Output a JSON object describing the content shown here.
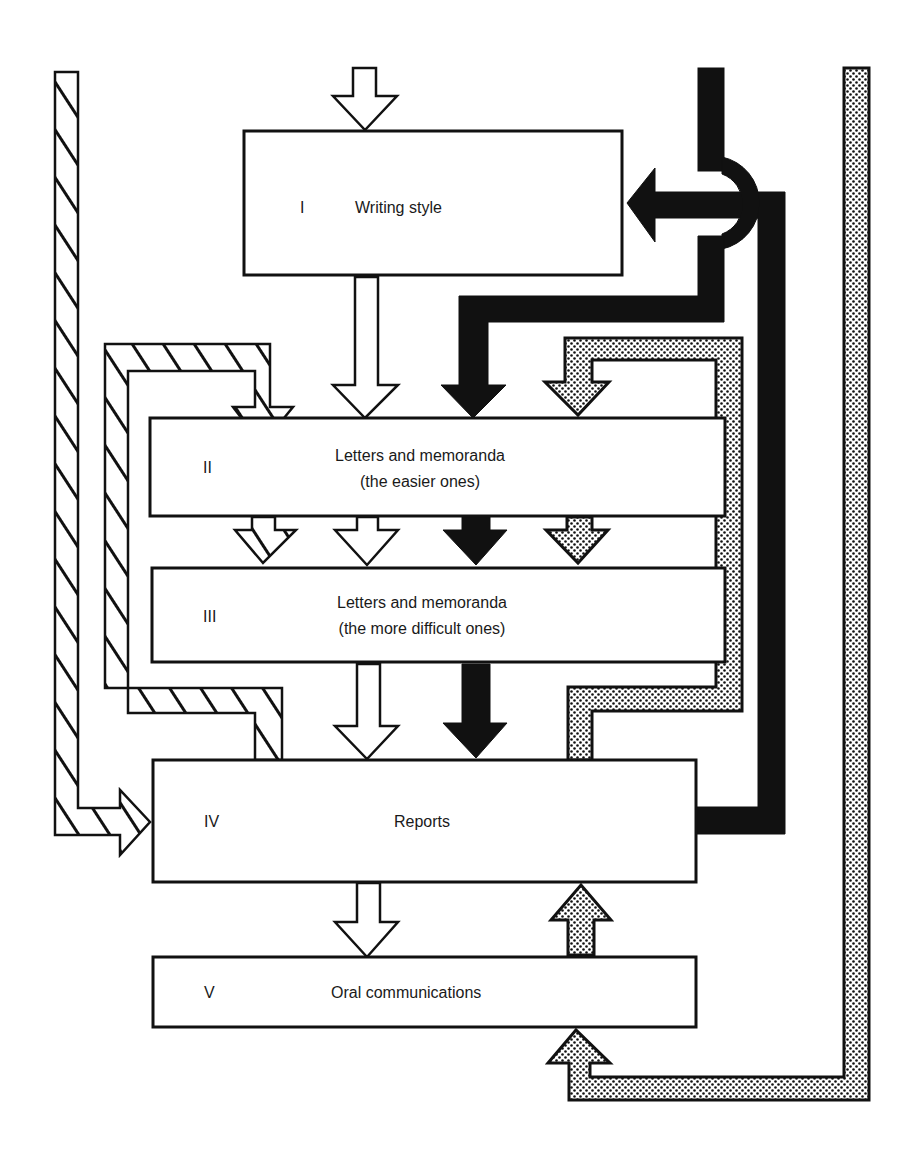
{
  "diagram": {
    "type": "flow-diagram",
    "boxes": [
      {
        "id": "I",
        "numeral": "I",
        "line1": "Writing style",
        "line2": ""
      },
      {
        "id": "II",
        "numeral": "II",
        "line1": "Letters and memoranda",
        "line2": "(the easier ones)"
      },
      {
        "id": "III",
        "numeral": "III",
        "line1": "Letters and memoranda",
        "line2": "(the more difficult ones)"
      },
      {
        "id": "IV",
        "numeral": "IV",
        "line1": "Reports",
        "line2": ""
      },
      {
        "id": "V",
        "numeral": "V",
        "line1": "Oral communications",
        "line2": ""
      }
    ],
    "flows": [
      {
        "style": "hollow",
        "description": "Main flow: enters I, then I → II → III → IV → V"
      },
      {
        "style": "solid",
        "description": "Feedback from IV loops right and up, crosses over, points left into I, and down into II → III → IV"
      },
      {
        "style": "dotted",
        "description": "Loop from above IV on right side into II → III; outer dotted loop from bottom into V and up into IV"
      },
      {
        "style": "hatched",
        "description": "Left hatched channel from top into IV; inner hatched loop from top of IV into II → III"
      }
    ],
    "fills": {
      "hollow": "#ffffff",
      "solid": "#111111",
      "dotted": "dot-screen",
      "hatched": "diagonal-hatch"
    }
  }
}
